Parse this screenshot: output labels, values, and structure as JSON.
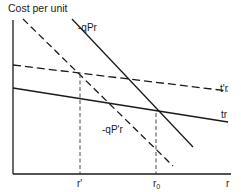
{
  "diagram": {
    "title": "Cost per unit",
    "axes": {
      "y_label": "Cost per unit",
      "x_label": "r"
    },
    "curves": [
      {
        "id": "neg-qPr",
        "label": "-qPr",
        "style": "solid"
      },
      {
        "id": "neg-qPprime-r",
        "label": "-qP'r",
        "style": "dashed"
      },
      {
        "id": "tprime-r",
        "label": "t'r",
        "style": "dashed"
      },
      {
        "id": "tr",
        "label": "tr",
        "style": "solid"
      }
    ],
    "x_ticks": [
      {
        "id": "r-prime",
        "label": "r'",
        "base": "r",
        "sub": "",
        "style": "dashed"
      },
      {
        "id": "r-zero",
        "label": "r0",
        "base": "r",
        "sub": "0",
        "style": "dashed"
      }
    ],
    "colors": {
      "ink": "#1a1a1a",
      "background": "#ffffff"
    }
  }
}
